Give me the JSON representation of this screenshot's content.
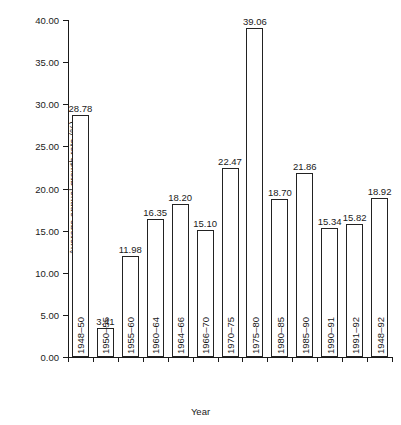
{
  "chart_data": {
    "type": "bar",
    "title": "",
    "xlabel": "Year",
    "ylabel": "Average annual growth rate (%)",
    "ylim": [
      0,
      40
    ],
    "ytick_step": 5,
    "ytick_labels": [
      "0.00",
      "5.00",
      "10.00",
      "15.00",
      "20.00",
      "25.00",
      "30.00",
      "35.00",
      "40.00"
    ],
    "ytick_values": [
      0,
      5,
      10,
      15,
      20,
      25,
      30,
      35,
      40
    ],
    "grid": false,
    "legend": null,
    "bar_fill": "#ffffff",
    "bar_edge": "#222222",
    "categories": [
      "1948–50",
      "1950–55",
      "1955–60",
      "1960–64",
      "1964–66",
      "1966–70",
      "1970–75",
      "1975–80",
      "1980–85",
      "1985–90",
      "1990–91",
      "1991–92",
      "1948–92"
    ],
    "values": [
      28.78,
      3.41,
      11.98,
      16.35,
      18.2,
      15.1,
      22.47,
      39.06,
      18.7,
      21.86,
      15.34,
      15.82,
      18.92
    ],
    "value_labels": [
      "28.78",
      "3.41",
      "11.98",
      "16.35",
      "18.20",
      "15.10",
      "22.47",
      "39.06",
      "18.70",
      "21.86",
      "15.34",
      "15.82",
      "18.92"
    ]
  }
}
